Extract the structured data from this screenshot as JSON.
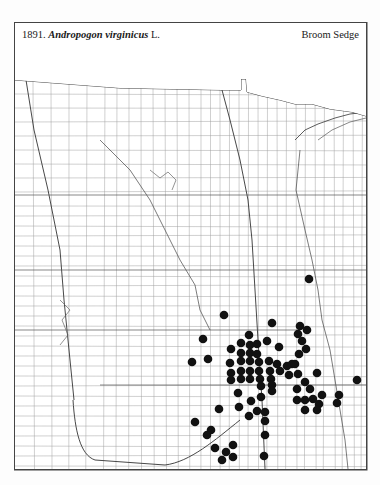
{
  "header": {
    "plate_number": "1891.",
    "species_name": "Andropogon virginicus",
    "author": "L.",
    "common_name": "Broom Sedge"
  },
  "map": {
    "frame": {
      "x": 14,
      "y": 22,
      "width": 353,
      "height": 448
    },
    "colors": {
      "frame": "#444444",
      "county_lines": "#9a9a9a",
      "state_lines": "#333333",
      "dot": "#111111",
      "background": "#ffffff"
    },
    "dot_radius": 4.3,
    "occurrence_dots": [
      [
        309,
        279
      ],
      [
        224,
        315
      ],
      [
        272,
        323
      ],
      [
        300,
        326
      ],
      [
        307,
        330
      ],
      [
        298,
        334
      ],
      [
        302,
        341
      ],
      [
        306,
        349
      ],
      [
        299,
        354
      ],
      [
        249,
        335
      ],
      [
        267,
        341
      ],
      [
        241,
        343
      ],
      [
        250,
        345
      ],
      [
        257,
        344
      ],
      [
        279,
        347
      ],
      [
        231,
        349
      ],
      [
        241,
        353
      ],
      [
        250,
        353
      ],
      [
        257,
        354
      ],
      [
        203,
        339
      ],
      [
        192,
        362
      ],
      [
        208,
        359
      ],
      [
        230,
        363
      ],
      [
        241,
        361
      ],
      [
        250,
        361
      ],
      [
        259,
        362
      ],
      [
        269,
        361
      ],
      [
        277,
        364
      ],
      [
        287,
        366
      ],
      [
        292,
        364
      ],
      [
        295,
        364
      ],
      [
        231,
        373
      ],
      [
        241,
        371
      ],
      [
        250,
        371
      ],
      [
        259,
        371
      ],
      [
        270,
        371
      ],
      [
        280,
        371
      ],
      [
        298,
        374
      ],
      [
        317,
        373
      ],
      [
        231,
        380
      ],
      [
        241,
        379
      ],
      [
        250,
        379
      ],
      [
        260,
        379
      ],
      [
        271,
        379
      ],
      [
        289,
        375
      ],
      [
        305,
        382
      ],
      [
        357,
        380
      ],
      [
        261,
        386
      ],
      [
        272,
        385
      ],
      [
        297,
        389
      ],
      [
        310,
        389
      ],
      [
        238,
        393
      ],
      [
        272,
        391
      ],
      [
        322,
        395
      ],
      [
        339,
        395
      ],
      [
        297,
        400
      ],
      [
        305,
        400
      ],
      [
        313,
        399
      ],
      [
        337,
        403
      ],
      [
        319,
        404
      ],
      [
        251,
        401
      ],
      [
        261,
        397
      ],
      [
        305,
        410
      ],
      [
        317,
        410
      ],
      [
        195,
        422
      ],
      [
        219,
        409
      ],
      [
        239,
        407
      ],
      [
        257,
        411
      ],
      [
        265,
        412
      ],
      [
        249,
        416
      ],
      [
        265,
        421
      ],
      [
        211,
        430
      ],
      [
        207,
        435
      ],
      [
        265,
        435
      ],
      [
        233,
        445
      ],
      [
        215,
        448
      ],
      [
        226,
        452
      ],
      [
        264,
        456
      ],
      [
        233,
        457
      ],
      [
        222,
        460
      ]
    ]
  }
}
